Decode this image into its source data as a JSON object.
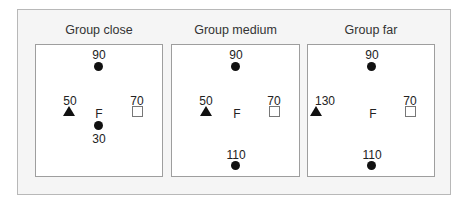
{
  "figure": {
    "groups": [
      {
        "title": "Group close",
        "focal_label": "F",
        "top": {
          "label": "90",
          "marker": "filled-circle"
        },
        "left": {
          "label": "50",
          "marker": "filled-triangle"
        },
        "right": {
          "label": "70",
          "marker": "open-square"
        },
        "bottom": {
          "label": "30",
          "marker": "filled-circle",
          "label_position": "below"
        }
      },
      {
        "title": "Group medium",
        "focal_label": "F",
        "top": {
          "label": "90",
          "marker": "filled-circle"
        },
        "left": {
          "label": "50",
          "marker": "filled-triangle"
        },
        "right": {
          "label": "70",
          "marker": "open-square"
        },
        "bottom": {
          "label": "110",
          "marker": "filled-circle",
          "label_position": "above"
        }
      },
      {
        "title": "Group far",
        "focal_label": "F",
        "top": {
          "label": "90",
          "marker": "filled-circle"
        },
        "left": {
          "label": "130",
          "marker": "filled-triangle"
        },
        "right": {
          "label": "70",
          "marker": "open-square"
        },
        "bottom": {
          "label": "110",
          "marker": "filled-circle",
          "label_position": "above"
        }
      }
    ],
    "colors": {
      "frame_border": "#b8b8b8",
      "frame_bg": "#f5f5f5",
      "panel_border": "#9e9e9e",
      "marker": "#111111",
      "square_outline": "#777777"
    }
  }
}
